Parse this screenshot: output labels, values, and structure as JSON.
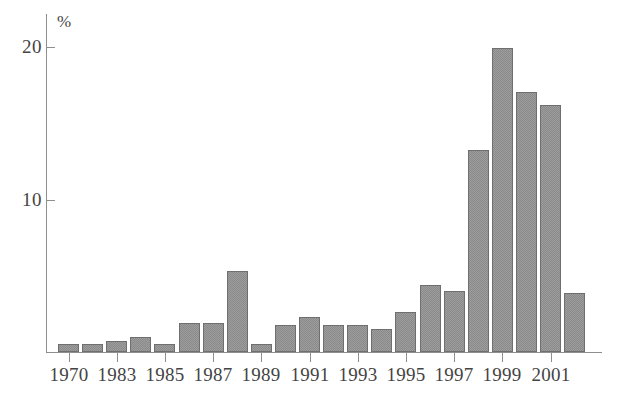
{
  "chart_data": {
    "type": "bar",
    "title": "",
    "subtitle": "",
    "xlabel": "",
    "ylabel": "%",
    "ylim": [
      0,
      22.2
    ],
    "xlim_note": "categorical years 1970, 1983-2002",
    "grid": false,
    "legend": "none",
    "y_ticks": [
      10,
      20
    ],
    "y_tick_labels": [
      "10",
      "20"
    ],
    "x_tick_labels": [
      "1970",
      "1983",
      "1985",
      "1987",
      "1989",
      "1991",
      "1993",
      "1995",
      "1997",
      "1999",
      "2001"
    ],
    "bar_color": "#8a8a8a",
    "bar_edge_color": "#6f6f6f",
    "axis_color": "#8e8e8e",
    "text_color": "#444444",
    "categories": [
      "1970",
      "1982",
      "1983",
      "1984",
      "1985",
      "1986",
      "1987",
      "1988",
      "1989",
      "1990",
      "1991",
      "1992",
      "1993",
      "1994",
      "1995",
      "1996",
      "1997",
      "1998",
      "1999",
      "2000",
      "2001",
      "2002"
    ],
    "values": [
      0.5,
      0.5,
      0.7,
      1.0,
      0.5,
      1.9,
      1.9,
      5.3,
      0.5,
      1.8,
      2.3,
      1.8,
      1.8,
      1.5,
      2.6,
      4.4,
      4.0,
      13.3,
      20.0,
      17.1,
      16.2,
      3.9
    ],
    "labeled_categories": [
      {
        "category": "1970",
        "value": 0.5,
        "tick_label": "1970"
      },
      {
        "category": "1982",
        "value": 0.5,
        "tick_label": ""
      },
      {
        "category": "1983",
        "value": 0.7,
        "tick_label": "1983"
      },
      {
        "category": "1984",
        "value": 1.0,
        "tick_label": ""
      },
      {
        "category": "1985",
        "value": 0.5,
        "tick_label": "1985"
      },
      {
        "category": "1986",
        "value": 1.9,
        "tick_label": ""
      },
      {
        "category": "1987",
        "value": 1.9,
        "tick_label": "1987"
      },
      {
        "category": "1988",
        "value": 5.3,
        "tick_label": ""
      },
      {
        "category": "1989",
        "value": 0.5,
        "tick_label": "1989"
      },
      {
        "category": "1990",
        "value": 1.8,
        "tick_label": ""
      },
      {
        "category": "1991",
        "value": 2.3,
        "tick_label": "1991"
      },
      {
        "category": "1992",
        "value": 1.8,
        "tick_label": ""
      },
      {
        "category": "1993",
        "value": 1.8,
        "tick_label": "1993"
      },
      {
        "category": "1994",
        "value": 1.5,
        "tick_label": ""
      },
      {
        "category": "1995",
        "value": 2.6,
        "tick_label": "1995"
      },
      {
        "category": "1996",
        "value": 4.4,
        "tick_label": ""
      },
      {
        "category": "1997",
        "value": 4.0,
        "tick_label": "1997"
      },
      {
        "category": "1998",
        "value": 13.3,
        "tick_label": ""
      },
      {
        "category": "1999",
        "value": 20.0,
        "tick_label": "1999"
      },
      {
        "category": "2000",
        "value": 17.1,
        "tick_label": ""
      },
      {
        "category": "2001",
        "value": 16.2,
        "tick_label": "2001"
      },
      {
        "category": "2002",
        "value": 3.9,
        "tick_label": ""
      }
    ]
  }
}
